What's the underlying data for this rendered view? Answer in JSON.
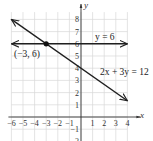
{
  "chart_data": {
    "type": "line",
    "title": "",
    "xlabel": "x",
    "ylabel": "y",
    "xlim": [
      -6,
      4
    ],
    "ylim": [
      -2,
      8
    ],
    "grid": true,
    "x_ticks": [
      "-6",
      "-5",
      "-4",
      "-3",
      "-2",
      "-1",
      "1",
      "2",
      "3",
      "4"
    ],
    "y_ticks": [
      "-2",
      "-1",
      "1",
      "2",
      "3",
      "4",
      "5",
      "6",
      "7",
      "8"
    ],
    "series": [
      {
        "name": "y = 6",
        "equation": "y = 6",
        "x": [
          -6,
          4
        ],
        "y": [
          6,
          6
        ]
      },
      {
        "name": "2x + 3y = 12",
        "equation": "2x + 3y = 12",
        "x": [
          -6,
          4
        ],
        "y": [
          8,
          1.333
        ]
      }
    ],
    "annotations": [
      {
        "text": "(−3, 6)",
        "x": -3,
        "y": 6,
        "type": "intersection-point"
      }
    ],
    "labels": {
      "line1": "y = 6",
      "line2": "2x + 3y = 12",
      "point": "(−3, 6)"
    }
  }
}
